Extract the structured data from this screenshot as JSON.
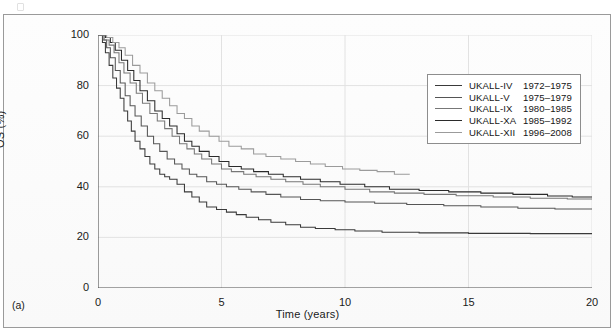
{
  "figure": {
    "panel_label": "(a)"
  },
  "chart_data": {
    "type": "line",
    "title": "",
    "subtitle": "",
    "xlabel": "Time (years)",
    "ylabel": "OS (%)",
    "xlim": [
      0,
      20
    ],
    "ylim": [
      0,
      100
    ],
    "xticks": [
      0,
      5,
      10,
      15,
      20
    ],
    "yticks": [
      0,
      20,
      40,
      60,
      80,
      100
    ],
    "xtick_labels": [
      "0",
      "5",
      "10",
      "15",
      "20"
    ],
    "ytick_labels": [
      "0",
      "20",
      "40",
      "60",
      "80",
      "100"
    ],
    "grid": "horizontal-and-vertical-light",
    "legend_position": "upper-right-inside",
    "curve_style": "kaplan-meier-step",
    "series": [
      {
        "name": "UKALL-IV",
        "years": "1972–1975",
        "color": "#3a3a3a",
        "final_value": 21.5,
        "x_end": 20,
        "points": [
          [
            0,
            100
          ],
          [
            0.18,
            97
          ],
          [
            0.3,
            93
          ],
          [
            0.45,
            88
          ],
          [
            0.6,
            83
          ],
          [
            0.75,
            79
          ],
          [
            0.9,
            75
          ],
          [
            1.05,
            70
          ],
          [
            1.2,
            66
          ],
          [
            1.35,
            62
          ],
          [
            1.5,
            58
          ],
          [
            1.7,
            55
          ],
          [
            1.9,
            52
          ],
          [
            2.1,
            49
          ],
          [
            2.3,
            47
          ],
          [
            2.5,
            45
          ],
          [
            2.7,
            44
          ],
          [
            2.9,
            43
          ],
          [
            3.2,
            41
          ],
          [
            3.5,
            38
          ],
          [
            3.8,
            36
          ],
          [
            4.1,
            34
          ],
          [
            4.4,
            32
          ],
          [
            4.8,
            31
          ],
          [
            5.2,
            30
          ],
          [
            5.6,
            29
          ],
          [
            6.0,
            28
          ],
          [
            6.5,
            27
          ],
          [
            7.0,
            26
          ],
          [
            7.6,
            25
          ],
          [
            8.2,
            24
          ],
          [
            8.8,
            23.5
          ],
          [
            9.6,
            23
          ],
          [
            10.4,
            22.5
          ],
          [
            11.5,
            22
          ],
          [
            13.0,
            21.8
          ],
          [
            15.0,
            21.6
          ],
          [
            17.5,
            21.5
          ],
          [
            20,
            21.5
          ]
        ]
      },
      {
        "name": "UKALL-V",
        "years": "1975–1979",
        "color": "#555555",
        "final_value": 31.0,
        "x_end": 20,
        "points": [
          [
            0,
            100
          ],
          [
            0.2,
            98
          ],
          [
            0.35,
            95
          ],
          [
            0.5,
            91
          ],
          [
            0.7,
            86
          ],
          [
            0.9,
            81
          ],
          [
            1.1,
            76
          ],
          [
            1.3,
            72
          ],
          [
            1.5,
            68
          ],
          [
            1.75,
            64
          ],
          [
            2.0,
            60
          ],
          [
            2.25,
            57
          ],
          [
            2.5,
            54
          ],
          [
            2.8,
            51
          ],
          [
            3.1,
            49
          ],
          [
            3.4,
            47
          ],
          [
            3.7,
            45
          ],
          [
            4.0,
            44
          ],
          [
            4.4,
            42
          ],
          [
            4.8,
            41
          ],
          [
            5.2,
            40
          ],
          [
            5.7,
            39
          ],
          [
            6.2,
            38
          ],
          [
            6.8,
            37
          ],
          [
            7.4,
            36
          ],
          [
            8.2,
            35
          ],
          [
            9.0,
            34.5
          ],
          [
            10.0,
            34
          ],
          [
            11.2,
            33.5
          ],
          [
            12.5,
            33
          ],
          [
            14.0,
            32.5
          ],
          [
            15.5,
            32
          ],
          [
            17.0,
            31.5
          ],
          [
            18.5,
            31.2
          ],
          [
            20,
            31.0
          ]
        ]
      },
      {
        "name": "UKALL-IX",
        "years": "1980–1985",
        "color": "#777777",
        "final_value": 35.0,
        "x_end": 20,
        "points": [
          [
            0,
            100
          ],
          [
            0.25,
            98
          ],
          [
            0.45,
            96
          ],
          [
            0.65,
            93
          ],
          [
            0.85,
            89
          ],
          [
            1.05,
            85
          ],
          [
            1.3,
            81
          ],
          [
            1.55,
            77
          ],
          [
            1.8,
            73
          ],
          [
            2.1,
            69
          ],
          [
            2.4,
            66
          ],
          [
            2.7,
            63
          ],
          [
            3.0,
            60
          ],
          [
            3.3,
            57
          ],
          [
            3.6,
            55
          ],
          [
            3.9,
            53
          ],
          [
            4.2,
            51
          ],
          [
            4.6,
            49
          ],
          [
            5.0,
            47
          ],
          [
            5.4,
            46
          ],
          [
            5.9,
            45
          ],
          [
            6.4,
            44
          ],
          [
            7.0,
            43
          ],
          [
            7.6,
            42
          ],
          [
            8.3,
            41
          ],
          [
            9.0,
            40
          ],
          [
            10.0,
            39
          ],
          [
            11.0,
            38
          ],
          [
            12.0,
            37.5
          ],
          [
            13.2,
            37
          ],
          [
            14.5,
            36.5
          ],
          [
            16.0,
            36
          ],
          [
            17.5,
            35.5
          ],
          [
            19.0,
            35.2
          ],
          [
            20,
            35.0
          ]
        ]
      },
      {
        "name": "UKALL-XA",
        "years": "1985–1992",
        "color": "#2b2b2b",
        "final_value": 35.8,
        "x_end": 20,
        "points": [
          [
            0,
            100
          ],
          [
            0.3,
            99
          ],
          [
            0.5,
            97
          ],
          [
            0.7,
            94
          ],
          [
            0.95,
            90
          ],
          [
            1.2,
            86
          ],
          [
            1.45,
            82
          ],
          [
            1.7,
            78
          ],
          [
            2.0,
            74
          ],
          [
            2.3,
            70
          ],
          [
            2.6,
            67
          ],
          [
            2.9,
            64
          ],
          [
            3.2,
            61
          ],
          [
            3.5,
            58
          ],
          [
            3.8,
            56
          ],
          [
            4.1,
            54
          ],
          [
            4.5,
            52
          ],
          [
            4.9,
            50
          ],
          [
            5.3,
            48
          ],
          [
            5.8,
            47
          ],
          [
            6.3,
            46
          ],
          [
            6.9,
            45
          ],
          [
            7.5,
            44
          ],
          [
            8.2,
            43
          ],
          [
            9.0,
            42
          ],
          [
            9.8,
            41
          ],
          [
            10.8,
            40
          ],
          [
            11.8,
            39
          ],
          [
            13.0,
            38.5
          ],
          [
            14.2,
            38
          ],
          [
            15.5,
            37.5
          ],
          [
            16.8,
            37
          ],
          [
            18.2,
            36.4
          ],
          [
            19.2,
            36
          ],
          [
            20,
            35.8
          ]
        ]
      },
      {
        "name": "UKALL-XII",
        "years": "1996–2008",
        "color": "#9b9b9b",
        "final_value": 44.8,
        "x_end": 12.6,
        "points": [
          [
            0,
            100
          ],
          [
            0.35,
            99
          ],
          [
            0.6,
            97
          ],
          [
            0.85,
            95
          ],
          [
            1.1,
            92
          ],
          [
            1.4,
            88
          ],
          [
            1.7,
            85
          ],
          [
            2.0,
            81
          ],
          [
            2.3,
            78
          ],
          [
            2.6,
            75
          ],
          [
            2.9,
            72
          ],
          [
            3.2,
            69
          ],
          [
            3.5,
            67
          ],
          [
            3.8,
            64
          ],
          [
            4.1,
            62
          ],
          [
            4.5,
            60
          ],
          [
            4.9,
            58
          ],
          [
            5.3,
            56
          ],
          [
            5.8,
            55
          ],
          [
            6.3,
            53
          ],
          [
            6.8,
            52
          ],
          [
            7.4,
            51
          ],
          [
            8.0,
            50
          ],
          [
            8.6,
            49
          ],
          [
            9.2,
            48
          ],
          [
            9.9,
            47
          ],
          [
            10.6,
            46.5
          ],
          [
            11.3,
            46
          ],
          [
            12.0,
            45
          ],
          [
            12.6,
            44.8
          ]
        ]
      }
    ]
  },
  "legend": {
    "rows": [
      {
        "name": "UKALL-IV",
        "years": "1972–1975"
      },
      {
        "name": "UKALL-V",
        "years": "1975–1979"
      },
      {
        "name": "UKALL-IX",
        "years": "1980–1985"
      },
      {
        "name": "UKALL-XA",
        "years": "1985–1992"
      },
      {
        "name": "UKALL-XII",
        "years": "1996–2008"
      }
    ]
  }
}
